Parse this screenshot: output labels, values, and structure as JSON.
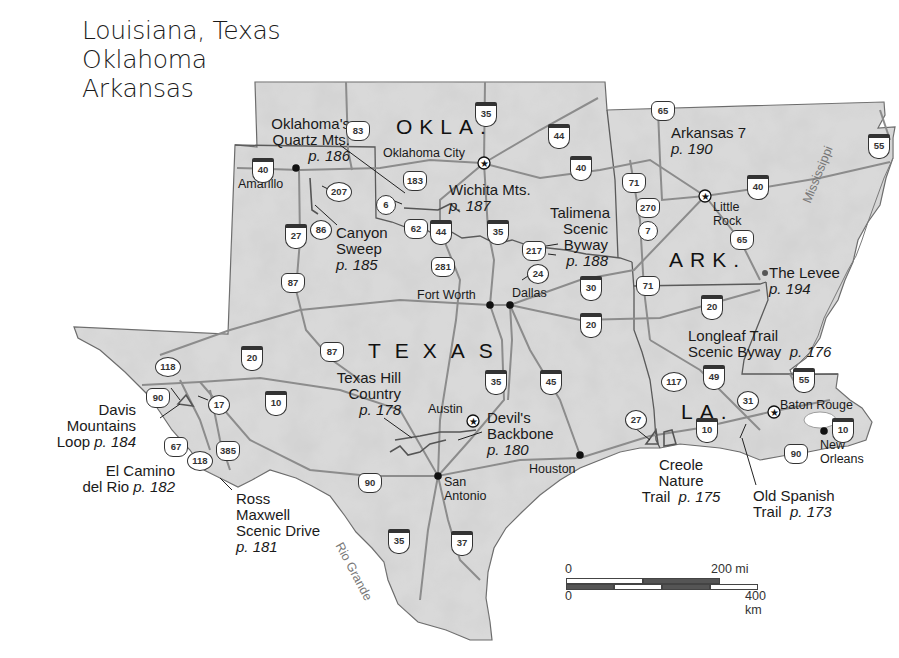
{
  "title": {
    "line1": "Louisiana, Texas",
    "line2": "Oklahoma",
    "line3": "Arkansas"
  },
  "states": {
    "okla": "OKLA.",
    "texas": "TEXAS",
    "ark": "ARK.",
    "la": "LA."
  },
  "cities": {
    "oklahoma_city": "Oklahoma City",
    "amarillo": "Amarillo",
    "little_rock_1": "Little",
    "little_rock_2": "Rock",
    "fort_worth": "Fort Worth",
    "dallas": "Dallas",
    "austin": "Austin",
    "san_antonio_1": "San",
    "san_antonio_2": "Antonio",
    "houston": "Houston",
    "baton_rouge": "Baton Rouge",
    "new_orleans_1": "New",
    "new_orleans_2": "Orleans"
  },
  "rivers": {
    "mississippi": "Mississippi",
    "rio_grande": "Rio Grande"
  },
  "routes": [
    {
      "name": "Oklahoma's Quartz Mts.",
      "lines": [
        "Oklahoma's",
        "Quartz Mts."
      ],
      "page": "p. 186"
    },
    {
      "name": "Wichita Mts.",
      "lines": [
        "Wichita Mts."
      ],
      "page": "p. 187"
    },
    {
      "name": "Canyon Sweep",
      "lines": [
        "Canyon",
        "Sweep"
      ],
      "page": "p. 185"
    },
    {
      "name": "Talimena Scenic Byway",
      "lines": [
        "Talimena",
        "Scenic",
        "Byway"
      ],
      "page": "p. 188"
    },
    {
      "name": "Arkansas 7",
      "lines": [
        "Arkansas 7"
      ],
      "page": "p. 190"
    },
    {
      "name": "The Levee",
      "lines": [
        "The Levee"
      ],
      "page": "p. 194"
    },
    {
      "name": "Longleaf Trail Scenic Byway",
      "lines": [
        "Longleaf Trail",
        "Scenic Byway"
      ],
      "page": "p. 176"
    },
    {
      "name": "Texas Hill Country",
      "lines": [
        "Texas Hill",
        "Country"
      ],
      "page": "p. 178"
    },
    {
      "name": "Devil's Backbone",
      "lines": [
        "Devil's",
        "Backbone"
      ],
      "page": "p. 180"
    },
    {
      "name": "Davis Mountains Loop",
      "lines": [
        "Davis",
        "Mountains",
        "Loop"
      ],
      "page": "p. 184"
    },
    {
      "name": "El Camino del Rio",
      "lines": [
        "El Camino",
        "del Rio"
      ],
      "page": "p. 182"
    },
    {
      "name": "Ross Maxwell Scenic Drive",
      "lines": [
        "Ross",
        "Maxwell",
        "Scenic Drive"
      ],
      "page": "p. 181"
    },
    {
      "name": "Creole Nature Trail",
      "lines": [
        "Creole",
        "Nature",
        "Trail"
      ],
      "page": "p. 175"
    },
    {
      "name": "Old Spanish Trail",
      "lines": [
        "Old Spanish",
        "Trail"
      ],
      "page": "p. 173"
    }
  ],
  "shields": {
    "interstate": [
      "35",
      "44",
      "40",
      "40",
      "40",
      "27",
      "44",
      "35",
      "30",
      "20",
      "20",
      "20",
      "10",
      "35",
      "45",
      "49",
      "55",
      "10",
      "10",
      "55",
      "37",
      "35"
    ],
    "us": [
      "83",
      "183",
      "62",
      "281",
      "87",
      "87",
      "65",
      "71",
      "270",
      "65",
      "71",
      "217",
      "90",
      "67",
      "385",
      "90",
      "90"
    ],
    "state": [
      "207",
      "86",
      "6",
      "24",
      "7",
      "118",
      "17",
      "118",
      "117",
      "27",
      "31"
    ]
  },
  "scale": {
    "top_zero": "0",
    "top_end": "200 mi",
    "bottom_zero": "0",
    "bottom_end": "400 km"
  },
  "colors": {
    "land": "#d9d9d9",
    "land_relief": "#c4c4c4",
    "road": "#8c8c8c",
    "border": "#555555",
    "water": "#ffffff"
  }
}
